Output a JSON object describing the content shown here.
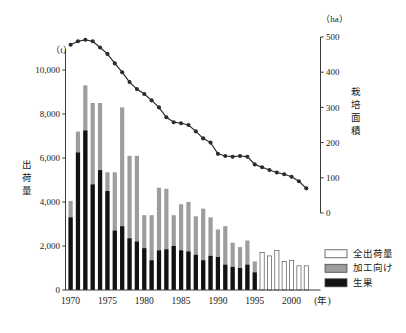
{
  "chart_data": {
    "type": "bar",
    "title": "",
    "subtitle": "",
    "xlabel": "(年)",
    "ylabel": "出荷量",
    "y2label": "栽培面積",
    "left_axis_unit": "（t）",
    "right_axis_unit": "（ha）",
    "ylim": [
      0,
      11000
    ],
    "y2lim": [
      0,
      500
    ],
    "left_ticks": [
      "0",
      "2,000",
      "4,000",
      "6,000",
      "8,000",
      "10,000"
    ],
    "left_tick_values": [
      0,
      2000,
      4000,
      6000,
      8000,
      10000
    ],
    "right_ticks": [
      "0",
      "100",
      "200",
      "300",
      "400",
      "500"
    ],
    "right_tick_values": [
      0,
      100,
      200,
      300,
      400,
      500
    ],
    "grid": false,
    "legend_position": "bottom-right",
    "categories": [
      "1970",
      "1971",
      "1972",
      "1973",
      "1974",
      "1975",
      "1976",
      "1977",
      "1978",
      "1979",
      "1980",
      "1981",
      "1982",
      "1983",
      "1984",
      "1985",
      "1986",
      "1987",
      "1988",
      "1989",
      "1990",
      "1991",
      "1992",
      "1993",
      "1994",
      "1995",
      "1996",
      "1997",
      "1998",
      "1999",
      "2000",
      "2001",
      "2002"
    ],
    "xtick_labels": [
      "1970",
      "1975",
      "1980",
      "1985",
      "1990",
      "1995",
      "2000"
    ],
    "xtick_categories": [
      "1970",
      "1975",
      "1980",
      "1985",
      "1990",
      "1995",
      "2000"
    ],
    "series": [
      {
        "name": "生果",
        "key": "fresh",
        "color": "#121212",
        "stacked": true,
        "values": [
          3300,
          6250,
          7250,
          4800,
          5450,
          4500,
          2700,
          2900,
          2350,
          2200,
          1900,
          1350,
          1800,
          1850,
          2000,
          1800,
          1750,
          1600,
          1350,
          1550,
          1500,
          1150,
          1050,
          1000,
          1150,
          800,
          null,
          null,
          null,
          null,
          null,
          null,
          null
        ]
      },
      {
        "name": "加工向け",
        "key": "processing",
        "color": "#9d9d9d",
        "stacked": true,
        "values": [
          750,
          950,
          2050,
          3700,
          3050,
          850,
          2650,
          5400,
          3750,
          3900,
          1500,
          2050,
          2850,
          2750,
          1400,
          2100,
          2250,
          1750,
          2350,
          1750,
          1250,
          1750,
          1100,
          950,
          1100,
          500,
          null,
          null,
          null,
          null,
          null,
          null,
          null
        ]
      },
      {
        "name": "全出荷量",
        "key": "total_only",
        "color": "#ffffff",
        "stacked": false,
        "values": [
          null,
          null,
          null,
          null,
          null,
          null,
          null,
          null,
          null,
          null,
          null,
          null,
          null,
          null,
          null,
          null,
          null,
          null,
          null,
          null,
          null,
          null,
          null,
          null,
          null,
          null,
          1700,
          1550,
          1800,
          1300,
          1350,
          1100,
          1100
        ]
      },
      {
        "name": "栽培面積",
        "key": "area",
        "type": "line",
        "color": "#2b2b2b",
        "axis": "right",
        "values": [
          478,
          488,
          492,
          488,
          470,
          452,
          425,
          400,
          372,
          352,
          338,
          320,
          300,
          272,
          258,
          255,
          250,
          232,
          212,
          200,
          168,
          162,
          160,
          162,
          160,
          138,
          130,
          122,
          115,
          110,
          103,
          90,
          70
        ]
      }
    ],
    "bar_totals": [
      4050,
      7200,
      9300,
      8500,
      8500,
      5350,
      5350,
      8300,
      6100,
      6100,
      3400,
      3400,
      4650,
      4600,
      3400,
      3900,
      4000,
      3350,
      3700,
      3300,
      2750,
      2900,
      2150,
      1950,
      2250,
      1300,
      1700,
      1550,
      1800,
      1300,
      1350,
      1100,
      1100
    ],
    "annotations": []
  },
  "legend": {
    "items": [
      {
        "label": "全出荷量",
        "swatch": "white"
      },
      {
        "label": "加工向け",
        "swatch": "gray"
      },
      {
        "label": "生果",
        "swatch": "black"
      }
    ]
  },
  "colors": {
    "fresh": "#121212",
    "processing": "#9d9d9d",
    "total": "#ffffff",
    "line": "#2b2b2b",
    "axis": "#3a3a3a",
    "text": "#1a1a1a"
  }
}
